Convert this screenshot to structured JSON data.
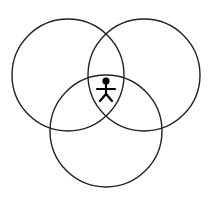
{
  "diagram": {
    "type": "venn",
    "circles": [
      {
        "id": "left",
        "cx": 68,
        "cy": 75,
        "r": 56
      },
      {
        "id": "right",
        "cx": 144,
        "cy": 75,
        "r": 56
      },
      {
        "id": "bottom",
        "cx": 106,
        "cy": 131,
        "r": 56
      }
    ],
    "center_icon": "person-icon",
    "stroke_color": "#222222",
    "figure_color": "#000000"
  }
}
